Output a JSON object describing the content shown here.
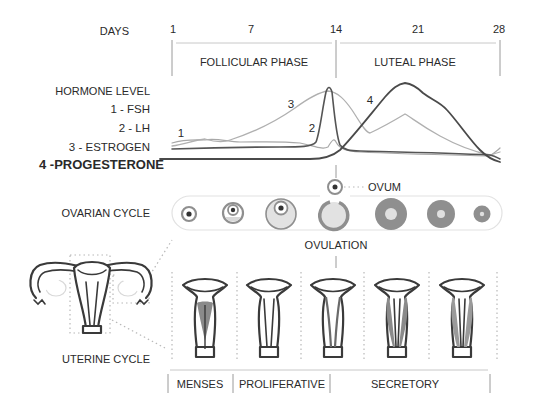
{
  "days_axis": {
    "label": "DAYS",
    "ticks": [
      "1",
      "7",
      "14",
      "21",
      "28"
    ]
  },
  "phases": {
    "follicular": "FOLLICULAR PHASE",
    "luteal": "LUTEAL PHASE"
  },
  "hormone_legend": {
    "title": "HORMONE LEVEL",
    "items": [
      {
        "num": "1",
        "label": "1 - FSH"
      },
      {
        "num": "2",
        "label": "2 - LH"
      },
      {
        "num": "3",
        "label": "3 - ESTROGEN"
      },
      {
        "num": "4",
        "label": "4 -PROGESTERONE"
      }
    ]
  },
  "curve_labels": {
    "fsh": "1",
    "lh": "2",
    "estrogen": "3",
    "progesterone": "4"
  },
  "ovarian": {
    "label": "OVARIAN CYCLE",
    "ovum_label": "OVUM",
    "ovulation_label": "OVULATION",
    "stages": [
      "primary follicle",
      "secondary follicle",
      "mature follicle",
      "ruptured follicle",
      "corpus luteum",
      "corpus luteum",
      "corpus albicans"
    ]
  },
  "uterine": {
    "label": "UTERINE CYCLE",
    "phases": [
      "MENSES",
      "PROLIFERATIVE",
      "SECRETORY"
    ]
  },
  "colors": {
    "text": "#2a2a2a",
    "curve_dark": "#555555",
    "curve_light": "#a8a8a8",
    "follicle_fill": "#dcdcdc",
    "follicle_ring": "#8f8f8f",
    "endometrium": "#8a8a8a"
  }
}
